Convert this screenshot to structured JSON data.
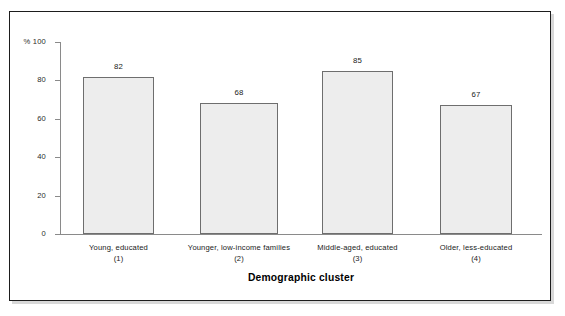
{
  "chart_data": {
    "type": "bar",
    "title": "",
    "xlabel": "Demographic cluster",
    "ylabel": "% 100",
    "categories": [
      "Young, educated",
      "Younger, low-income families",
      "Middle-aged, educated",
      "Older, less-educated"
    ],
    "category_numbers": [
      "(1)",
      "(2)",
      "(3)",
      "(4)"
    ],
    "values": [
      82,
      68,
      85,
      67
    ],
    "ylim": [
      0,
      100
    ],
    "yticks": [
      100,
      80,
      60,
      40,
      20,
      0
    ],
    "ytick_labels": [
      "% 100",
      "80",
      "60",
      "40",
      "20",
      "0"
    ],
    "grid": false,
    "legend": false,
    "bar_fill_color": "#ededed",
    "bar_border_color": "#6e6e6e",
    "axis_color": "#8a8a8a",
    "frame_color": "#1d1d1d",
    "background_color": "#ffffff"
  }
}
